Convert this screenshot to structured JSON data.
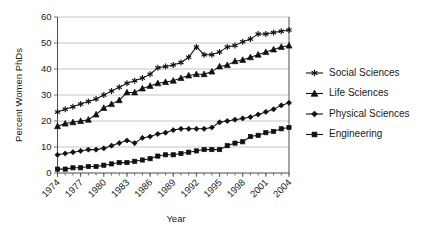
{
  "chart_data": {
    "type": "line",
    "title": "",
    "xlabel": "Year",
    "ylabel": "Percent Women PhDs",
    "xlim": [
      1974,
      2004
    ],
    "ylim": [
      0,
      60
    ],
    "yticks": [
      0,
      10,
      20,
      30,
      40,
      50,
      60
    ],
    "xticks": [
      1974,
      1977,
      1980,
      1983,
      1986,
      1989,
      1992,
      1995,
      1998,
      2001,
      2004
    ],
    "grid": "horizontal",
    "legend_position": "right",
    "x": [
      1974,
      1975,
      1976,
      1977,
      1978,
      1979,
      1980,
      1981,
      1982,
      1983,
      1984,
      1985,
      1986,
      1987,
      1988,
      1989,
      1990,
      1991,
      1992,
      1993,
      1994,
      1995,
      1996,
      1997,
      1998,
      1999,
      2000,
      2001,
      2002,
      2003,
      2004
    ],
    "series": [
      {
        "name": "Social Sciences",
        "marker": "star",
        "values": [
          23.5,
          24.5,
          25.5,
          26.5,
          27.5,
          28.5,
          30.0,
          31.5,
          33.0,
          34.5,
          35.5,
          36.5,
          38.0,
          40.5,
          41.0,
          41.5,
          42.5,
          44.5,
          48.5,
          45.5,
          45.5,
          46.5,
          48.5,
          49.0,
          50.5,
          51.5,
          53.5,
          53.5,
          54.0,
          54.5,
          55.0
        ]
      },
      {
        "name": "Life Sciences",
        "marker": "triangle",
        "values": [
          18.0,
          19.0,
          19.5,
          20.0,
          20.5,
          22.5,
          25.0,
          26.5,
          28.0,
          31.0,
          31.0,
          32.5,
          33.5,
          34.5,
          35.0,
          35.5,
          36.5,
          37.5,
          38.0,
          38.0,
          39.0,
          41.0,
          41.5,
          43.0,
          43.5,
          44.5,
          45.5,
          46.5,
          47.5,
          48.5,
          49.0
        ]
      },
      {
        "name": "Physical Sciences",
        "marker": "diamond",
        "values": [
          7.0,
          7.5,
          8.0,
          8.5,
          9.0,
          9.0,
          9.5,
          10.5,
          11.5,
          12.5,
          11.5,
          13.5,
          14.0,
          15.0,
          15.5,
          16.5,
          17.0,
          17.0,
          17.0,
          17.0,
          17.5,
          19.5,
          20.0,
          20.5,
          21.0,
          21.5,
          22.5,
          23.5,
          24.5,
          26.0,
          27.0
        ]
      },
      {
        "name": "Engineering",
        "marker": "square",
        "values": [
          1.5,
          1.5,
          2.0,
          2.0,
          2.5,
          2.5,
          3.0,
          3.5,
          4.0,
          4.0,
          4.5,
          5.0,
          5.5,
          6.5,
          7.0,
          7.0,
          7.5,
          8.0,
          8.5,
          9.0,
          9.0,
          9.0,
          10.5,
          11.5,
          12.0,
          14.0,
          14.5,
          15.5,
          16.0,
          17.0,
          17.5
        ]
      }
    ]
  },
  "legend": {
    "items": [
      {
        "label": "Social Sciences",
        "marker": "star-marker"
      },
      {
        "label": "Life Sciences",
        "marker": "triangle-marker"
      },
      {
        "label": "Physical Sciences",
        "marker": "diamond-marker"
      },
      {
        "label": "Engineering",
        "marker": "square-marker"
      }
    ]
  }
}
